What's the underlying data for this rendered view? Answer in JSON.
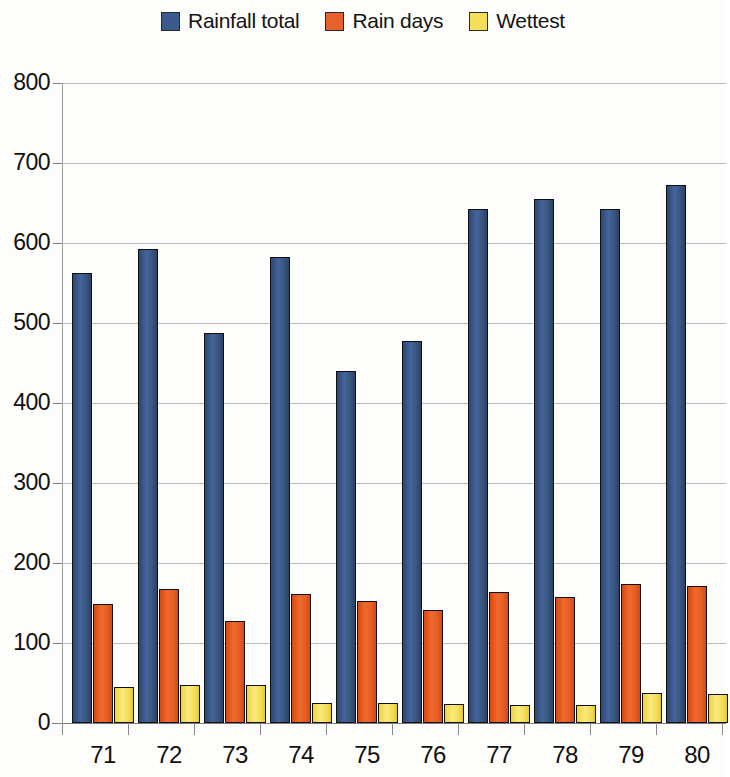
{
  "chart_data": {
    "type": "bar",
    "title": "",
    "subtitle": "",
    "xlabel": "",
    "ylabel": "",
    "ylim": [
      0,
      800
    ],
    "ytick_step": 100,
    "yticks": [
      0,
      100,
      200,
      300,
      400,
      500,
      600,
      700,
      800
    ],
    "grid": true,
    "legend_position": "top-center",
    "categories": [
      "71",
      "72",
      "73",
      "74",
      "75",
      "76",
      "77",
      "78",
      "79",
      "80"
    ],
    "series": [
      {
        "name": "Rainfall total",
        "color": "#3a5a8c",
        "values": [
          563,
          593,
          487,
          583,
          440,
          477,
          643,
          655,
          643,
          672
        ]
      },
      {
        "name": "Rain days",
        "color": "#e8602c",
        "values": [
          149,
          168,
          128,
          161,
          152,
          141,
          164,
          157,
          174,
          171
        ]
      },
      {
        "name": "Wettest",
        "color": "#f5de5a",
        "values": [
          45,
          48,
          48,
          25,
          25,
          24,
          23,
          23,
          37,
          36
        ]
      }
    ]
  },
  "legend": {
    "entries": [
      {
        "label": "Rainfall total"
      },
      {
        "label": "Rain days"
      },
      {
        "label": "Wettest"
      }
    ]
  }
}
